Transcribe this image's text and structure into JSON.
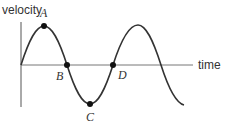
{
  "diagram": {
    "type": "velocity-time sine graph",
    "y_axis_label": "velocity",
    "x_axis_label": "time",
    "colors": {
      "axis": "#555555",
      "curve": "#333333",
      "point": "#111111",
      "text": "#333333"
    },
    "points": [
      {
        "label": "A",
        "description": "maximum velocity (crest)"
      },
      {
        "label": "B",
        "description": "zero crossing (descending)"
      },
      {
        "label": "C",
        "description": "minimum velocity (trough)"
      },
      {
        "label": "D",
        "description": "zero crossing (ascending)"
      }
    ]
  }
}
